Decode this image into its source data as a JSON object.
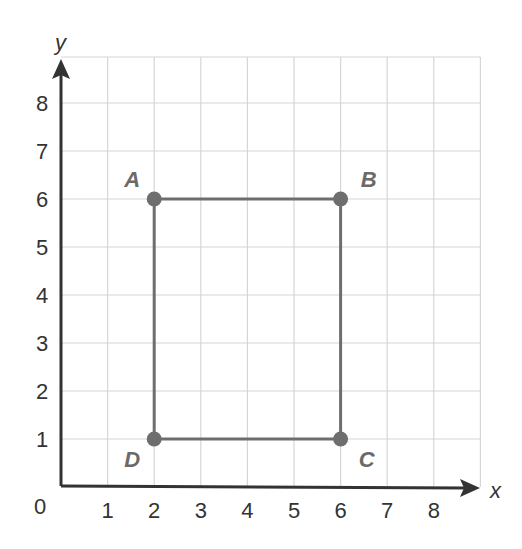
{
  "diagram": {
    "type": "coordinate-grid",
    "axes": {
      "x_label": "x",
      "y_label": "y",
      "origin_label": "0",
      "x_ticks": [
        "1",
        "2",
        "3",
        "4",
        "5",
        "6",
        "7",
        "8"
      ],
      "y_ticks": [
        "1",
        "2",
        "3",
        "4",
        "5",
        "6",
        "7",
        "8"
      ]
    },
    "points": [
      {
        "name": "A",
        "x": 2,
        "y": 6
      },
      {
        "name": "B",
        "x": 6,
        "y": 6
      },
      {
        "name": "C",
        "x": 6,
        "y": 1
      },
      {
        "name": "D",
        "x": 2,
        "y": 1
      }
    ],
    "polygon": [
      "A",
      "B",
      "C",
      "D"
    ],
    "colors": {
      "grid": "#d6d6d6",
      "axis": "#333333",
      "shape": "#6e6e6e",
      "point_label": "#6a6a6a"
    }
  }
}
